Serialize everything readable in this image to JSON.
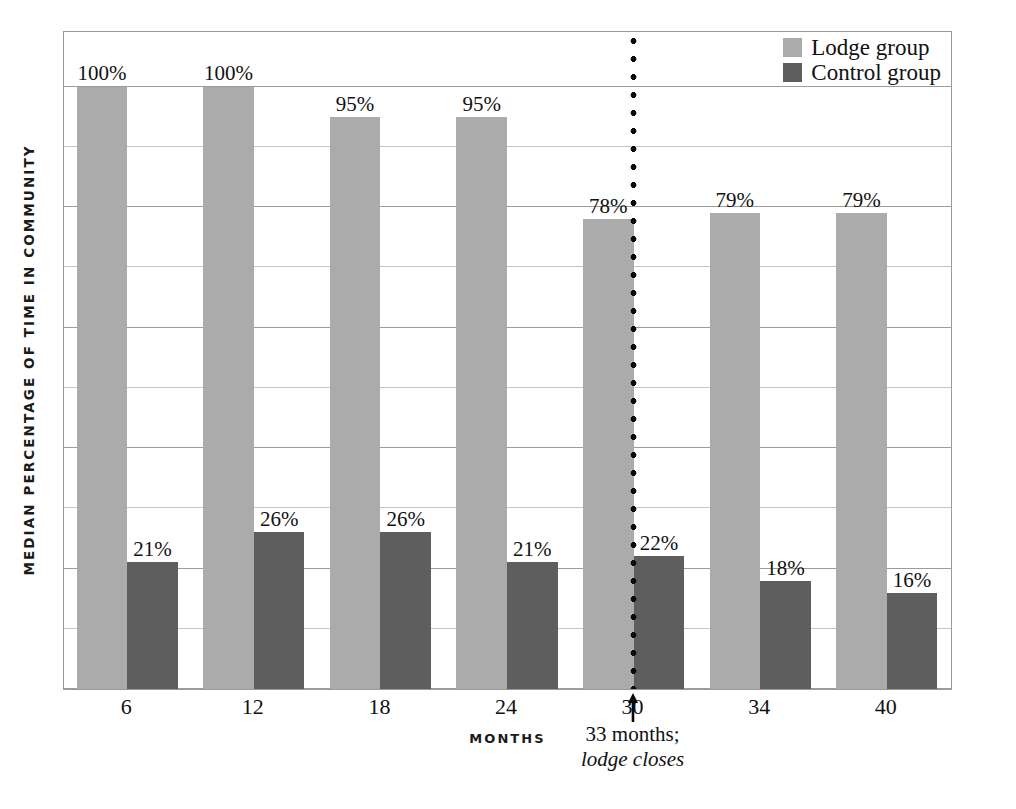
{
  "chart_data": {
    "type": "bar",
    "title": "",
    "xlabel": "MONTHS",
    "ylabel": "MEDIAN PERCENTAGE OF TIME IN COMMUNITY",
    "categories": [
      "6",
      "12",
      "18",
      "24",
      "30",
      "34",
      "40"
    ],
    "ylim": [
      0,
      100
    ],
    "y_gridlines": [
      0,
      10,
      20,
      30,
      40,
      50,
      60,
      70,
      80,
      90,
      100
    ],
    "grid": true,
    "legend_position": "top-right",
    "series": [
      {
        "name": "Lodge group",
        "color": "#ababab",
        "values": [
          100,
          100,
          95,
          95,
          78,
          79,
          79
        ],
        "labels": [
          "100%",
          "100%",
          "95%",
          "95%",
          "78%",
          "79%",
          "79%"
        ]
      },
      {
        "name": "Control group",
        "color": "#5e5e5e",
        "values": [
          21,
          26,
          26,
          21,
          22,
          18,
          16
        ],
        "labels": [
          "21%",
          "26%",
          "26%",
          "21%",
          "22%",
          "18%",
          "16%"
        ]
      }
    ],
    "annotations": [
      {
        "name": "lodge-closes-marker",
        "at_category_boundary": 4.5,
        "month": 33,
        "line1": "33 months;",
        "line2": "lodge closes",
        "style": "dotted-vertical-line-with-up-arrow",
        "color": "#0a0a0a"
      }
    ]
  },
  "legend": {
    "items": [
      {
        "label": "Lodge group",
        "color": "#ababab"
      },
      {
        "label": "Control group",
        "color": "#5e5e5e"
      }
    ]
  },
  "axes": {
    "y_title": "MEDIAN PERCENTAGE OF TIME IN COMMUNITY",
    "x_title": "MONTHS",
    "x_ticks": [
      "6",
      "12",
      "18",
      "24",
      "30",
      "34",
      "40"
    ]
  },
  "colors": {
    "lodge": "#ababab",
    "control": "#5e5e5e",
    "grid": "#9c9c9c",
    "frame": "#9a9a9a",
    "text": "#111111",
    "marker": "#0a0a0a"
  }
}
